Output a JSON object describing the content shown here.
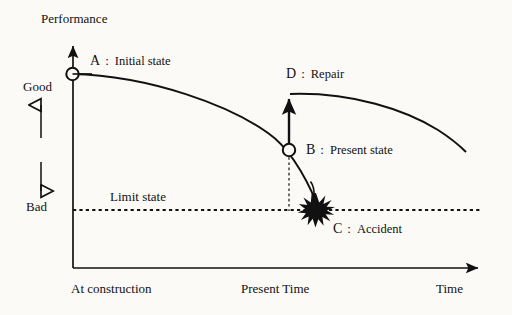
{
  "figure": {
    "type": "diagram",
    "background_color": "#fbfaf7",
    "ink_color": "#111111"
  },
  "axes": {
    "y_axis_title": "Performance",
    "x_axis_title": "Time",
    "y_high_label": "Good",
    "y_low_label": "Bad",
    "x_origin_label": "At construction",
    "x_mid_label": "Present Time",
    "y_axis_x": 73,
    "x_axis_y": 268,
    "y_axis_top": 42,
    "x_axis_right": 483
  },
  "reference_lines": {
    "limit_state_label": "Limit state",
    "limit_state_y": 210,
    "present_time_x": 289
  },
  "annotations": [
    {
      "key": "A",
      "separator": ":",
      "text": "Initial state",
      "marker": "circle",
      "point": {
        "x": 72,
        "y": 74
      },
      "label_x": 90,
      "label_y": 55
    },
    {
      "key": "B",
      "separator": ":",
      "text": "Present state",
      "marker": "circle",
      "point": {
        "x": 289,
        "y": 150
      },
      "label_x": 307,
      "label_y": 143
    },
    {
      "key": "C",
      "separator": ":",
      "text": "Accident",
      "marker": "starburst",
      "point": {
        "x": 316,
        "y": 210
      },
      "label_x": 333,
      "label_y": 223
    },
    {
      "key": "D",
      "separator": ":",
      "text": "Repair",
      "marker": "up-arrow",
      "point": {
        "x": 289,
        "y": 96
      },
      "label_x": 287,
      "label_y": 68
    }
  ],
  "curves": [
    {
      "name": "deterioration-curve",
      "from": "A",
      "to": "C",
      "path": "M 72 74 C 150 76 232 108 270 135 C 290 150 308 183 317 207"
    },
    {
      "name": "post-repair-curve",
      "from": "D",
      "path": "M 289 95 C 350 93 404 110 438 130 C 452 138 460 145 466 151"
    }
  ],
  "arrows": {
    "good_direction": "up",
    "bad_direction": "down",
    "repair_direction": "up"
  }
}
